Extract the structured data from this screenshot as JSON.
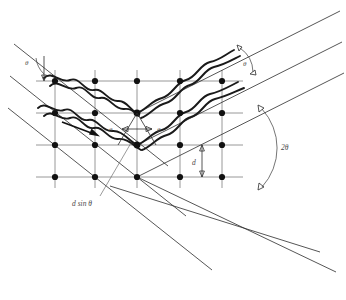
{
  "figure": {
    "labels": {
      "theta_incident": "θ",
      "theta_left_center": "θ",
      "theta_right_center": "θ",
      "theta_scattered": "θ",
      "two_theta": "2θ",
      "path_difference": "d sin θ",
      "interplanar_spacing": "d"
    },
    "colors": {
      "background": "#ffffff",
      "ray": "#2b2b2b",
      "lattice_plane": "#8c8c8c",
      "wave": "#1a1a1a",
      "atom": "#111111",
      "text": "#4a4a4a"
    },
    "lattice": {
      "columns_x": [
        55,
        95,
        137,
        180,
        222
      ],
      "rows_y": [
        81,
        113,
        145,
        177
      ],
      "atom_radius": 3.1,
      "plane_x_start": 36,
      "plane_x_end": 243,
      "column_y_start": 70,
      "column_y_end": 188
    },
    "incident_rays": [
      {
        "x1": 14,
        "y1": 44,
        "x2": 160,
        "y2": 160
      },
      {
        "x1": 10,
        "y1": 74,
        "x2": 180,
        "y2": 208
      },
      {
        "x1": 8,
        "y1": 106,
        "x2": 205,
        "y2": 262
      }
    ],
    "scattered_rays": [
      {
        "x1": 137,
        "y1": 113,
        "x2": 338,
        "y2": 13
      },
      {
        "x1": 137,
        "y1": 145,
        "x2": 340,
        "y2": 44
      },
      {
        "x1": 137,
        "y1": 177,
        "x2": 342,
        "y2": 75
      }
    ],
    "transmitted_rays": [
      {
        "x1": 137,
        "y1": 113,
        "x2": 330,
        "y2": 205
      },
      {
        "x1": 137,
        "y1": 145,
        "x2": 333,
        "y2": 238
      },
      {
        "x1": 137,
        "y1": 177,
        "x2": 336,
        "y2": 272
      }
    ],
    "direction_arrow": {
      "x1": 62,
      "y1": 122,
      "x2": 98,
      "y2": 136
    },
    "annotations": {
      "d_dimension": {
        "x": 202,
        "y_top": 145,
        "y_bottom": 177
      },
      "path_diff_dimension": {
        "y": 128,
        "x_left": 120,
        "x_right": 152
      }
    }
  }
}
